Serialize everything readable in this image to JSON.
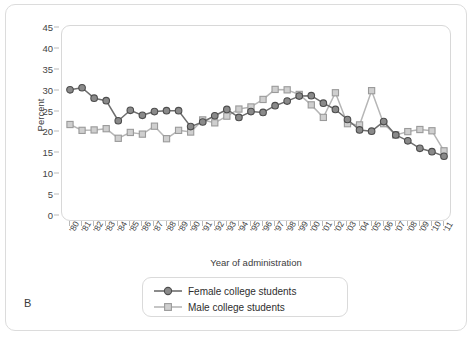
{
  "figure": {
    "panel_label": "B"
  },
  "legend": {
    "position": "bottom-center",
    "entries": [
      {
        "label": "Female college students",
        "marker": "circle",
        "color": "#6e6e6e"
      },
      {
        "label": "Male college students",
        "marker": "square",
        "color": "#b6b6b6"
      }
    ]
  },
  "chart_data": {
    "type": "line",
    "title": "",
    "subtitle": "",
    "xlabel": "Year of administration",
    "ylabel": "Percent",
    "ylim": [
      0,
      45
    ],
    "ytick_step": 5,
    "yticks": [
      0,
      5,
      10,
      15,
      20,
      25,
      30,
      35,
      40,
      45
    ],
    "grid": false,
    "x": [
      "'80",
      "'81",
      "'82",
      "'83",
      "'84",
      "'85",
      "'86",
      "'87",
      "'88",
      "'89",
      "'90",
      "'91",
      "'92",
      "'93",
      "'94",
      "'95",
      "'96",
      "'97",
      "'98",
      "'99",
      "'00",
      "'01",
      "'02",
      "'03",
      "'04",
      "'05",
      "'06",
      "'07",
      "'08",
      "'09",
      "'10",
      "'11"
    ],
    "categories": [
      "'80",
      "'81",
      "'82",
      "'83",
      "'84",
      "'85",
      "'86",
      "'87",
      "'88",
      "'89",
      "'90",
      "'91",
      "'92",
      "'93",
      "'94",
      "'95",
      "'96",
      "'97",
      "'98",
      "'99",
      "'00",
      "'01",
      "'02",
      "'03",
      "'04",
      "'05",
      "'06",
      "'07",
      "'08",
      "'09",
      "'10",
      "'11"
    ],
    "series": [
      {
        "name": "Female college students",
        "marker": "circle",
        "color": "#6e6e6e",
        "values": [
          30.2,
          30.7,
          28.2,
          27.6,
          22.8,
          25.3,
          24.1,
          25.0,
          25.2,
          25.2,
          21.4,
          22.5,
          24.0,
          25.5,
          23.6,
          25.0,
          24.8,
          26.4,
          27.5,
          28.7,
          28.8,
          27.0,
          25.5,
          23.1,
          20.6,
          20.3,
          22.6,
          19.4,
          18.0,
          16.2,
          15.4,
          14.3
        ]
      },
      {
        "name": "Male college students",
        "marker": "square",
        "color": "#b6b6b6",
        "values": [
          21.9,
          20.5,
          20.6,
          20.9,
          18.6,
          20.0,
          19.6,
          21.5,
          18.5,
          20.5,
          20.1,
          23.0,
          22.3,
          23.9,
          25.6,
          26.1,
          27.9,
          30.3,
          30.2,
          29.1,
          26.6,
          23.6,
          29.5,
          22.1,
          21.8,
          30.0,
          22.1,
          19.4,
          20.2,
          20.7,
          20.4,
          15.6
        ]
      }
    ]
  }
}
